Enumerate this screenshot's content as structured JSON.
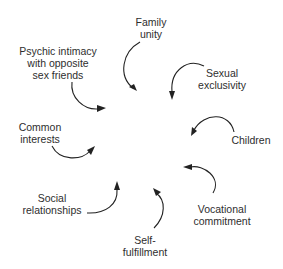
{
  "diagram": {
    "type": "radial-influence",
    "ink_color": "#222222",
    "text_color": "#2e2e2e",
    "background": "#ffffff",
    "factors": [
      {
        "id": "family-unity",
        "lines": [
          "Family",
          "unity"
        ],
        "x": 151,
        "y": 16
      },
      {
        "id": "sexual-exclusivity",
        "lines": [
          "Sexual",
          "exclusivity"
        ],
        "x": 222,
        "y": 67
      },
      {
        "id": "children",
        "lines": [
          "Children"
        ],
        "x": 251,
        "y": 134
      },
      {
        "id": "vocational-commitment",
        "lines": [
          "Vocational",
          "commitment"
        ],
        "x": 222,
        "y": 203
      },
      {
        "id": "self-fulfillment",
        "lines": [
          "Self-",
          "fulfillment"
        ],
        "x": 145,
        "y": 234
      },
      {
        "id": "social-relationships",
        "lines": [
          "Social",
          "relationships"
        ],
        "x": 52,
        "y": 192
      },
      {
        "id": "common-interests",
        "lines": [
          "Common",
          "interests"
        ],
        "x": 40,
        "y": 121
      },
      {
        "id": "psychic-intimacy",
        "lines": [
          "Psychic intimacy",
          "with opposite",
          "sex friends"
        ],
        "x": 58,
        "y": 45
      }
    ],
    "arrows": [
      {
        "from": "family-unity",
        "path": "M 140 42 C 122 52, 118 76, 133 88",
        "head_at": [
          137,
          91
        ],
        "head_angle": 45
      },
      {
        "from": "sexual-exclusivity",
        "path": "M 204 66 C 188 58, 170 70, 172 92",
        "head_at": [
          172,
          99
        ],
        "head_angle": 90
      },
      {
        "from": "children",
        "path": "M 234 132 C 230 112, 204 112, 194 130",
        "head_at": [
          192,
          134
        ],
        "head_angle": 120
      },
      {
        "from": "vocational-commitment",
        "path": "M 213 193 C 222 178, 204 164, 190 167",
        "head_at": [
          184,
          167
        ],
        "head_angle": 180
      },
      {
        "from": "self-fulfillment",
        "path": "M 154 228 C 166 216, 166 200, 156 193",
        "head_at": [
          154,
          189
        ],
        "head_angle": 235
      },
      {
        "from": "social-relationships",
        "path": "M 87 213 C 106 214, 118 204, 117 190",
        "head_at": [
          117,
          182
        ],
        "head_angle": 270
      },
      {
        "from": "common-interests",
        "path": "M 52 146 C 60 162, 82 160, 90 151",
        "head_at": [
          94,
          148
        ],
        "head_angle": 320
      },
      {
        "from": "psychic-intimacy",
        "path": "M 72 82 C 70 98, 84 110, 98 109",
        "head_at": [
          104,
          108
        ],
        "head_angle": 350
      }
    ]
  }
}
